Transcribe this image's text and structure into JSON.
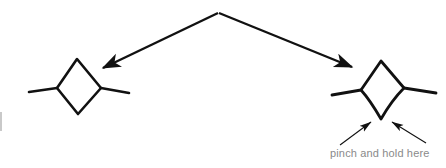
{
  "figure": {
    "width": 446,
    "height": 168,
    "background_color": "#ffffff",
    "stroke_color": "#111111",
    "caption_color": "#8a8a8a",
    "artifact_color": "#c9c9c9"
  },
  "caption": {
    "text": "pinch and hold here"
  },
  "shapes": {
    "left_kite": {
      "name": "relaxed-kite-shape",
      "top": [
        77,
        59
      ],
      "left": [
        57,
        88
      ],
      "right": [
        101,
        88
      ],
      "bottom": [
        78,
        114
      ],
      "left_whisker_end": [
        29,
        92
      ],
      "right_whisker_end": [
        129,
        93
      ]
    },
    "right_kite": {
      "name": "pinched-kite-shape",
      "top": [
        381,
        61
      ],
      "left": [
        361,
        90
      ],
      "right": [
        404,
        88
      ],
      "bottom": [
        381,
        119
      ],
      "left_whisker_end": [
        332,
        95
      ],
      "right_whisker_end": [
        436,
        93
      ]
    }
  },
  "arrows": {
    "origin": [
      218,
      13
    ],
    "to_left_shape": {
      "name": "arrow-to-left-shape",
      "from": [
        218,
        13
      ],
      "to": [
        99,
        70
      ]
    },
    "to_right_shape": {
      "name": "arrow-to-right-shape",
      "from": [
        218,
        13
      ],
      "to": [
        357,
        69
      ]
    },
    "pinch_left": {
      "name": "pinch-arrow-left",
      "from": [
        340,
        145
      ],
      "to": [
        375,
        119
      ]
    },
    "pinch_right": {
      "name": "pinch-arrow-right",
      "from": [
        426,
        143
      ],
      "to": [
        388,
        119
      ]
    }
  }
}
